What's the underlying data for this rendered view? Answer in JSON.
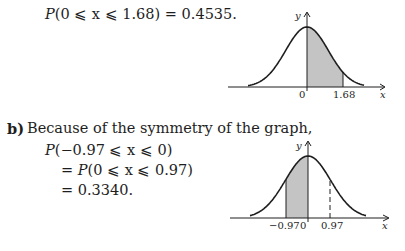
{
  "part_a": {
    "equation_prefix": "P",
    "equation_rest": "(0 ⩽ x ⩽ 1.68) = 0.4535."
  },
  "part_b": {
    "label": "b)",
    "intro": "Because of the symmetry of the graph,",
    "line1_prefix": "P",
    "line1_rest": "(−0.97 ⩽ x ⩽ 0)",
    "line2_eq": "= ",
    "line2_prefix": "P",
    "line2_rest": "(0 ⩽ x ⩽ 0.97)",
    "line3": "= 0.3340."
  },
  "chart_data": [
    {
      "type": "area",
      "title": "Standard normal curve, shaded 0 ≤ x ≤ 1.68",
      "xlabel": "x",
      "ylabel": "y",
      "tick_labels": [
        "0",
        "1.68"
      ],
      "shaded_interval": [
        0,
        1.68
      ],
      "shaded_probability": 0.4535,
      "xlim": [
        -3,
        3
      ],
      "grid": false
    },
    {
      "type": "area",
      "title": "Standard normal curve, shaded −0.97 ≤ x ≤ 0",
      "xlabel": "x",
      "ylabel": "y",
      "tick_labels": [
        "−0.97",
        "0",
        "0.97"
      ],
      "shaded_interval": [
        -0.97,
        0
      ],
      "dashed_marker": 0.97,
      "shaded_probability": 0.334,
      "xlim": [
        -3,
        3
      ],
      "grid": false
    }
  ],
  "colors": {
    "ink": "#1e1e1e",
    "shade": "#c4c4c4"
  }
}
